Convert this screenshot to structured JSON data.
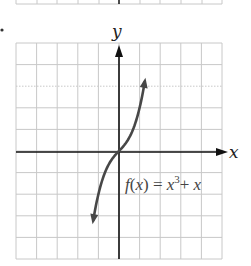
{
  "chart_data": {
    "type": "line",
    "title": "",
    "function_label": "f(x) = x³+ x",
    "function_label_parts": {
      "f": "f",
      "open": "(",
      "var": "x",
      "close": ")",
      "eq": " = ",
      "base": "x",
      "exp": "3",
      "plus": "+ ",
      "tail": "x"
    },
    "xlabel": "x",
    "ylabel": "y",
    "xlim": [
      -5,
      5
    ],
    "ylim": [
      -5,
      5
    ],
    "grid": true,
    "grid_step": 1,
    "series": [
      {
        "name": "f(x) = x^3 + x",
        "x": [
          -1.25,
          -1.1,
          -1.0,
          -0.8,
          -0.6,
          -0.4,
          -0.2,
          0,
          0.2,
          0.4,
          0.6,
          0.8,
          1.0,
          1.1,
          1.25
        ],
        "values": [
          -3.2,
          -2.43,
          -2.0,
          -1.31,
          -0.82,
          -0.46,
          -0.21,
          0,
          0.21,
          0.46,
          0.82,
          1.31,
          2.0,
          2.43,
          3.2
        ]
      }
    ],
    "arrows": {
      "curve_ends": true,
      "axes": [
        "x+",
        "y+"
      ]
    }
  },
  "labels": {
    "x_axis": "x",
    "y_axis": "y",
    "bullet": "•"
  },
  "colors": {
    "grid": "#c8c8c8",
    "axis": "#111111",
    "curve": "#474747",
    "text": "#333333"
  }
}
